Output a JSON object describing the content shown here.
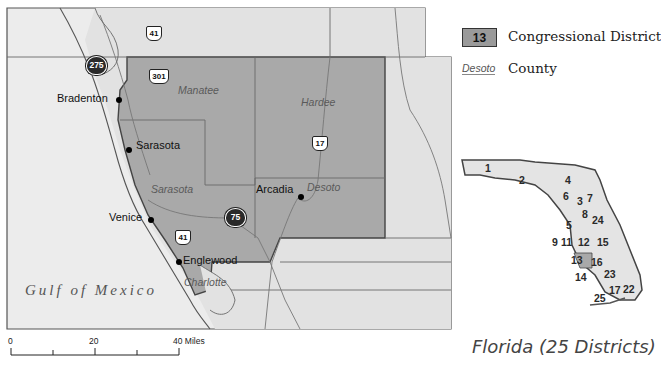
{
  "map": {
    "cities": [
      {
        "name": "Bradenton"
      },
      {
        "name": "Sarasota"
      },
      {
        "name": "Venice"
      },
      {
        "name": "Englewood"
      },
      {
        "name": "Arcadia"
      }
    ],
    "counties": [
      {
        "name": "Manatee"
      },
      {
        "name": "Hardee"
      },
      {
        "name": "Sarasota"
      },
      {
        "name": "Desoto"
      },
      {
        "name": "Charlotte"
      }
    ],
    "water_label": "Gulf of Mexico",
    "highways": {
      "us41_top": "41",
      "i275": "275",
      "us301": "301",
      "us17": "17",
      "i75": "75",
      "us41_bottom": "41"
    },
    "scale_bar": {
      "tick0": "0",
      "tick20": "20",
      "tick40": "40 Miles"
    },
    "colors": {
      "district_fill": "#a8a8a8",
      "land_fill": "#e4e4e4",
      "water_fill": "#ededed",
      "border": "#444444"
    }
  },
  "legend": {
    "district_sample": "13",
    "district_label": "Congressional District",
    "county_sample": "Desoto",
    "county_label": "County"
  },
  "inset": {
    "title": "Florida (25 Districts)",
    "district_numbers": [
      "1",
      "2",
      "4",
      "3",
      "7",
      "6",
      "8",
      "24",
      "5",
      "9",
      "11",
      "12",
      "15",
      "13",
      "16",
      "14",
      "23",
      "17",
      "22",
      "25"
    ]
  }
}
